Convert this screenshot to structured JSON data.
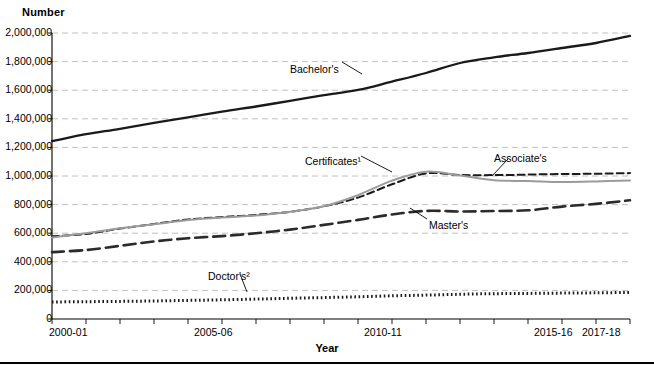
{
  "chart_data": {
    "type": "line",
    "title": "",
    "ylabel": "Number",
    "xlabel": "Year",
    "ylim": [
      0,
      2000000
    ],
    "ytick_labels": [
      "2,000,000",
      "1,800,000",
      "1,600,000",
      "1,400,000",
      "1,200,000",
      "1,000,000",
      "800,000",
      "600,000",
      "400,000",
      "200,000",
      "0"
    ],
    "ytick_values": [
      2000000,
      1800000,
      1600000,
      1400000,
      1200000,
      1000000,
      800000,
      600000,
      400000,
      200000,
      0
    ],
    "grid": true,
    "legend_position": "inline-annotations",
    "x": [
      "2000-01",
      "2001-02",
      "2002-03",
      "2003-04",
      "2004-05",
      "2005-06",
      "2006-07",
      "2007-08",
      "2008-09",
      "2009-10",
      "2010-11",
      "2011-12",
      "2012-13",
      "2013-14",
      "2014-15",
      "2015-16",
      "2016-17",
      "2017-18"
    ],
    "xtick_labels": [
      "2000-01",
      "2005-06",
      "2010-11",
      "2015-16",
      "2017-18"
    ],
    "xtick_label_index": [
      0,
      5,
      10,
      15,
      17
    ],
    "series": [
      {
        "name": "Bachelor's",
        "style": "solid",
        "color": "#1a1a1a",
        "label": "Bachelor's",
        "values": [
          1244000,
          1292000,
          1330000,
          1372000,
          1410000,
          1450000,
          1486000,
          1526000,
          1566000,
          1602000,
          1660000,
          1720000,
          1790000,
          1830000,
          1860000,
          1895000,
          1930000,
          1980000
        ]
      },
      {
        "name": "Associate's",
        "style": "dashed-short",
        "color": "#1a1a1a",
        "label": "Associate's",
        "values": [
          578000,
          595000,
          632000,
          665000,
          696000,
          713000,
          728000,
          750000,
          788000,
          849000,
          942000,
          1018000,
          1007000,
          1006000,
          1010000,
          1014000,
          1016000,
          1020000
        ]
      },
      {
        "name": "Certificates",
        "style": "solid-gray",
        "color": "#9b9b9b",
        "label": "Certificates¹",
        "values": [
          570000,
          600000,
          634000,
          662000,
          692000,
          710000,
          723000,
          750000,
          789000,
          866000,
          968000,
          1030000,
          1003000,
          970000,
          965000,
          958000,
          962000,
          968000
        ]
      },
      {
        "name": "Master's",
        "style": "dashed-long",
        "color": "#2b2b2b",
        "label": "Master's",
        "values": [
          468000,
          482000,
          512000,
          542000,
          565000,
          580000,
          600000,
          625000,
          658000,
          693000,
          731000,
          756000,
          752000,
          755000,
          760000,
          786000,
          805000,
          830000
        ]
      },
      {
        "name": "Doctor's",
        "style": "dotted",
        "color": "#1a1a1a",
        "label": "Doctor's²",
        "values": [
          119000,
          121000,
          123000,
          126000,
          130000,
          134000,
          139000,
          145000,
          150000,
          155000,
          162000,
          167000,
          173000,
          177000,
          179000,
          181000,
          183000,
          186000
        ]
      }
    ],
    "annotations": [
      {
        "text": "Bachelor's",
        "x": 290,
        "y": 63
      },
      {
        "text": "Certificates¹",
        "x": 305,
        "y": 155
      },
      {
        "text": "Associate's",
        "x": 494,
        "y": 152
      },
      {
        "text": "Master's",
        "x": 429,
        "y": 219
      },
      {
        "text": "Doctor's²",
        "x": 208,
        "y": 270
      }
    ]
  }
}
